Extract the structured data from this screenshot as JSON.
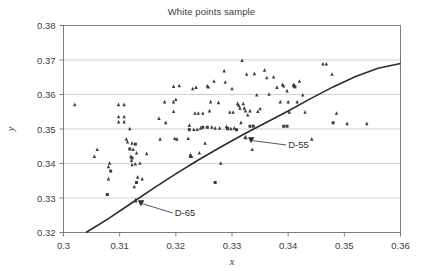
{
  "chart_data": {
    "type": "scatter",
    "title": "White points sample",
    "xlabel": "x",
    "ylabel": "y",
    "xlim": [
      0.3,
      0.36
    ],
    "ylim": [
      0.32,
      0.38
    ],
    "xticks": [
      "0.3",
      "0.31",
      "0.32",
      "0.33",
      "0.34",
      "0.35",
      "0.36"
    ],
    "xtick_values": [
      0.3,
      0.31,
      0.32,
      0.33,
      0.34,
      0.35,
      0.36
    ],
    "yticks": [
      "0.32",
      "0.33",
      "0.34",
      "0.35",
      "0.36",
      "0.37",
      "0.38"
    ],
    "ytick_values": [
      0.32,
      0.33,
      0.34,
      0.35,
      0.36,
      0.37,
      0.38
    ],
    "grid": "horizontal",
    "legend": "none",
    "series": [
      {
        "name": "white-points-triangle",
        "marker": "triangle",
        "color": "#3c3c3c",
        "points": [
          [
            0.302,
            0.357
          ],
          [
            0.306,
            0.344
          ],
          [
            0.3055,
            0.342
          ],
          [
            0.308,
            0.339
          ],
          [
            0.3082,
            0.34
          ],
          [
            0.308,
            0.3355
          ],
          [
            0.3098,
            0.357
          ],
          [
            0.3108,
            0.357
          ],
          [
            0.3098,
            0.3535
          ],
          [
            0.3098,
            0.352
          ],
          [
            0.3108,
            0.3535
          ],
          [
            0.3108,
            0.352
          ],
          [
            0.3112,
            0.347
          ],
          [
            0.3114,
            0.3462
          ],
          [
            0.3118,
            0.35
          ],
          [
            0.3122,
            0.3458
          ],
          [
            0.3124,
            0.344
          ],
          [
            0.312,
            0.342
          ],
          [
            0.3121,
            0.3408
          ],
          [
            0.3128,
            0.3398
          ],
          [
            0.3122,
            0.3396
          ],
          [
            0.313,
            0.343
          ],
          [
            0.3132,
            0.336
          ],
          [
            0.3126,
            0.3332
          ],
          [
            0.3136,
            0.34
          ],
          [
            0.314,
            0.3355
          ],
          [
            0.3148,
            0.3428
          ],
          [
            0.317,
            0.353
          ],
          [
            0.3172,
            0.347
          ],
          [
            0.318,
            0.3578
          ],
          [
            0.3182,
            0.3518
          ],
          [
            0.3196,
            0.3623
          ],
          [
            0.3196,
            0.3578
          ],
          [
            0.3196,
            0.355
          ],
          [
            0.3198,
            0.3472
          ],
          [
            0.32,
            0.3585
          ],
          [
            0.3202,
            0.347
          ],
          [
            0.3206,
            0.3625
          ],
          [
            0.3222,
            0.3472
          ],
          [
            0.3224,
            0.351
          ],
          [
            0.3226,
            0.3425
          ],
          [
            0.323,
            0.3616
          ],
          [
            0.3228,
            0.342
          ],
          [
            0.3232,
            0.3498
          ],
          [
            0.3234,
            0.3545
          ],
          [
            0.3236,
            0.362
          ],
          [
            0.3238,
            0.3498
          ],
          [
            0.324,
            0.3545
          ],
          [
            0.3242,
            0.343
          ],
          [
            0.3244,
            0.3502
          ],
          [
            0.3248,
            0.3545
          ],
          [
            0.3252,
            0.3458
          ],
          [
            0.3256,
            0.3624
          ],
          [
            0.3258,
            0.3621
          ],
          [
            0.3262,
            0.3578
          ],
          [
            0.326,
            0.3552
          ],
          [
            0.3268,
            0.3638
          ],
          [
            0.3264,
            0.3505
          ],
          [
            0.327,
            0.3502
          ],
          [
            0.3276,
            0.3576
          ],
          [
            0.3278,
            0.3502
          ],
          [
            0.328,
            0.34
          ],
          [
            0.3286,
            0.3668
          ],
          [
            0.3288,
            0.3635
          ],
          [
            0.329,
            0.3506
          ],
          [
            0.3292,
            0.35
          ],
          [
            0.3296,
            0.3548
          ],
          [
            0.3298,
            0.35
          ],
          [
            0.33,
            0.3616
          ],
          [
            0.3302,
            0.3548
          ],
          [
            0.3304,
            0.3502
          ],
          [
            0.331,
            0.3573
          ],
          [
            0.3312,
            0.3568
          ],
          [
            0.3314,
            0.356
          ],
          [
            0.3316,
            0.3518
          ],
          [
            0.3318,
            0.3698
          ],
          [
            0.332,
            0.3573
          ],
          [
            0.3322,
            0.356
          ],
          [
            0.3324,
            0.3552
          ],
          [
            0.3326,
            0.3658
          ],
          [
            0.3328,
            0.354
          ],
          [
            0.3332,
            0.3552
          ],
          [
            0.3336,
            0.344
          ],
          [
            0.334,
            0.366
          ],
          [
            0.3344,
            0.3598
          ],
          [
            0.3346,
            0.355
          ],
          [
            0.335,
            0.3558
          ],
          [
            0.3358,
            0.367
          ],
          [
            0.3362,
            0.3648
          ],
          [
            0.3366,
            0.36
          ],
          [
            0.3374,
            0.365
          ],
          [
            0.338,
            0.362
          ],
          [
            0.3386,
            0.3578
          ],
          [
            0.339,
            0.3628
          ],
          [
            0.3392,
            0.3624
          ],
          [
            0.3398,
            0.361
          ],
          [
            0.34,
            0.3578
          ],
          [
            0.3402,
            0.3548
          ],
          [
            0.341,
            0.3628
          ],
          [
            0.3416,
            0.3578
          ],
          [
            0.342,
            0.3638
          ],
          [
            0.3426,
            0.3598
          ],
          [
            0.343,
            0.3548
          ],
          [
            0.3442,
            0.347
          ],
          [
            0.3462,
            0.3688
          ],
          [
            0.3468,
            0.3688
          ],
          [
            0.3478,
            0.3658
          ],
          [
            0.3486,
            0.3545
          ],
          [
            0.354,
            0.3515
          ],
          [
            0.3505,
            0.3515
          ]
        ]
      },
      {
        "name": "white-points-square",
        "marker": "square",
        "color": "#3c3c3c",
        "points": [
          [
            0.3078,
            0.331
          ],
          [
            0.3084,
            0.3378
          ],
          [
            0.3118,
            0.3442
          ],
          [
            0.3122,
            0.3416
          ],
          [
            0.3128,
            0.3456
          ],
          [
            0.313,
            0.3345
          ],
          [
            0.3224,
            0.3498
          ],
          [
            0.3226,
            0.342
          ],
          [
            0.3248,
            0.3505
          ],
          [
            0.3256,
            0.3505
          ],
          [
            0.327,
            0.3345
          ],
          [
            0.3292,
            0.3502
          ],
          [
            0.3332,
            0.3508
          ],
          [
            0.3338,
            0.3508
          ],
          [
            0.3392,
            0.3508
          ],
          [
            0.3398,
            0.3508
          ],
          [
            0.341,
            0.3625
          ],
          [
            0.3412,
            0.3622
          ],
          [
            0.348,
            0.3518
          ],
          [
            0.3308,
            0.3498
          ]
        ]
      }
    ],
    "locus": {
      "name": "daylight-locus",
      "color": "#2b2b2b",
      "points": [
        [
          0.304,
          0.32
        ],
        [
          0.308,
          0.324
        ],
        [
          0.312,
          0.3284
        ],
        [
          0.316,
          0.3328
        ],
        [
          0.32,
          0.337
        ],
        [
          0.324,
          0.341
        ],
        [
          0.328,
          0.3448
        ],
        [
          0.332,
          0.3484
        ],
        [
          0.336,
          0.3518
        ],
        [
          0.34,
          0.3552
        ],
        [
          0.344,
          0.3588
        ],
        [
          0.348,
          0.3622
        ],
        [
          0.352,
          0.3652
        ],
        [
          0.356,
          0.3676
        ],
        [
          0.36,
          0.369
        ]
      ]
    },
    "annotations": [
      {
        "name": "d55-annotation",
        "label": "D-55",
        "point": [
          0.3324,
          0.3475
        ],
        "label_x": 0.34,
        "label_y": 0.3445
      },
      {
        "name": "d65-annotation",
        "label": "D-65",
        "point": [
          0.3128,
          0.3292
        ],
        "label_x": 0.3198,
        "label_y": 0.3248
      }
    ]
  }
}
